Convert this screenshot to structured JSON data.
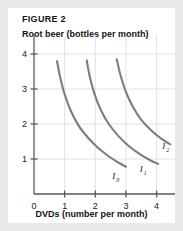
{
  "figure": {
    "label": "FIGURE 2",
    "y_axis_title": "Root beer (bottles per month)",
    "x_axis_title": "DVDs (number per month)"
  },
  "colors": {
    "panel_background": "#ffffff",
    "page_background": "#e9e9e7",
    "curve": "#7d7d7d",
    "axis": "#5a5a5a",
    "gridline": "#e2e2e2",
    "text": "#141414"
  },
  "chart_data": {
    "type": "line",
    "title": "FIGURE 2",
    "xlabel": "DVDs (number per month)",
    "ylabel": "Root beer (bottles per month)",
    "xlim": [
      0,
      4.6
    ],
    "ylim": [
      0,
      4.4
    ],
    "xticks": [
      "0",
      "1",
      "2",
      "3",
      "4"
    ],
    "xtick_values": [
      0,
      1,
      2,
      3,
      4
    ],
    "yticks": [
      "1",
      "2",
      "3",
      "4"
    ],
    "ytick_values": [
      1,
      2,
      3,
      4
    ],
    "grid": true,
    "legend": "none",
    "annotations": [
      {
        "text": "I",
        "sub": "0",
        "x": 2.55,
        "y": 0.42
      },
      {
        "text": "I",
        "sub": "1",
        "x": 3.45,
        "y": 0.62
      },
      {
        "text": "I",
        "sub": "2",
        "x": 4.18,
        "y": 1.28
      }
    ],
    "series": [
      {
        "name": "I0",
        "label": "I",
        "subscript": "0",
        "points": [
          {
            "x": 0.75,
            "y": 3.8
          },
          {
            "x": 0.85,
            "y": 3.35
          },
          {
            "x": 1.0,
            "y": 2.85
          },
          {
            "x": 1.2,
            "y": 2.38
          },
          {
            "x": 1.45,
            "y": 1.96
          },
          {
            "x": 1.75,
            "y": 1.62
          },
          {
            "x": 2.05,
            "y": 1.35
          },
          {
            "x": 2.4,
            "y": 1.1
          },
          {
            "x": 2.75,
            "y": 0.9
          },
          {
            "x": 3.0,
            "y": 0.78
          }
        ]
      },
      {
        "name": "I1",
        "label": "I",
        "subscript": "1",
        "points": [
          {
            "x": 1.72,
            "y": 3.82
          },
          {
            "x": 1.82,
            "y": 3.35
          },
          {
            "x": 1.97,
            "y": 2.87
          },
          {
            "x": 2.18,
            "y": 2.4
          },
          {
            "x": 2.44,
            "y": 2.0
          },
          {
            "x": 2.75,
            "y": 1.66
          },
          {
            "x": 3.08,
            "y": 1.38
          },
          {
            "x": 3.45,
            "y": 1.14
          },
          {
            "x": 3.82,
            "y": 0.95
          },
          {
            "x": 4.05,
            "y": 0.86
          }
        ]
      },
      {
        "name": "I2",
        "label": "I",
        "subscript": "2",
        "points": [
          {
            "x": 2.7,
            "y": 3.85
          },
          {
            "x": 2.82,
            "y": 3.4
          },
          {
            "x": 2.99,
            "y": 2.94
          },
          {
            "x": 3.22,
            "y": 2.5
          },
          {
            "x": 3.5,
            "y": 2.12
          },
          {
            "x": 3.82,
            "y": 1.82
          },
          {
            "x": 4.15,
            "y": 1.58
          },
          {
            "x": 4.45,
            "y": 1.42
          }
        ]
      }
    ]
  }
}
